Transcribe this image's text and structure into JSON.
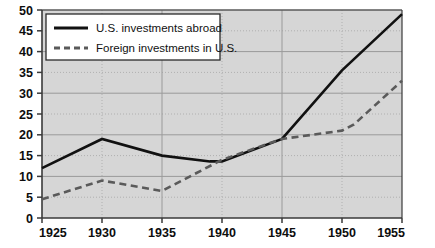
{
  "chart_data": {
    "type": "line",
    "title": "",
    "subtitle": "",
    "xlabel": "",
    "ylabel": "",
    "xlim": [
      1925,
      1955
    ],
    "ylim": [
      0,
      50
    ],
    "grid": true,
    "legend_position": "top-left",
    "x_ticks": [
      "1925",
      "1930",
      "1935",
      "1940",
      "1945",
      "1950",
      "1955"
    ],
    "y_ticks": [
      "0",
      "5",
      "10",
      "15",
      "20",
      "25",
      "30",
      "35",
      "40",
      "45",
      "50"
    ],
    "y_major_gridlines": [
      0,
      10,
      20,
      30,
      40,
      50
    ],
    "y_minor_gridlines": [
      5,
      15,
      25,
      35,
      45
    ],
    "x_major_gridlines": [
      1935,
      1945
    ],
    "x_minor_gridlines": [
      1930,
      1940,
      1950
    ],
    "series": [
      {
        "name": "U.S. investments abroad",
        "style": "solid",
        "color": "#111111",
        "x": [
          1925,
          1930,
          1935,
          1939,
          1940,
          1945,
          1950,
          1955
        ],
        "values": [
          12,
          19,
          15,
          13.6,
          13.6,
          19,
          35.5,
          49
        ]
      },
      {
        "name": "Foreign investments in U.S.",
        "style": "dashed",
        "color": "#5a5a5a",
        "x": [
          1925,
          1930,
          1935,
          1940,
          1945,
          1950,
          1951,
          1955
        ],
        "values": [
          4.5,
          9,
          6.5,
          14,
          19,
          21,
          22.5,
          33
        ]
      }
    ]
  },
  "legend": {
    "items": [
      {
        "label": "U.S. investments abroad",
        "style": "solid"
      },
      {
        "label": "Foreign investments in U.S.",
        "style": "dashed"
      }
    ]
  },
  "colors": {
    "plot_background": "#d6d6d6",
    "axis": "#3a3a3a",
    "major_grid": "#9a9a9a",
    "minor_grid": "#b0b0b0",
    "series_solid": "#111111",
    "series_dashed": "#5a5a5a",
    "legend_background": "#ffffff",
    "legend_border": "#2a2a2a",
    "text": "#0d0d0d"
  }
}
